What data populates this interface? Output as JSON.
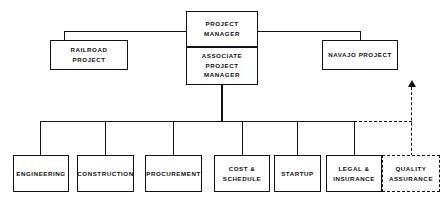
{
  "diagram": {
    "type": "organization-chart",
    "colors": {
      "line": "#111111",
      "box_border": "#111111",
      "background": "#ffffff",
      "text": "#111111"
    },
    "nodes": {
      "project_manager": {
        "label": "PROJECT MANAGER",
        "style": "solid"
      },
      "associate_project_manager": {
        "label": "ASSOCIATE\nPROJECT MANAGER",
        "style": "solid"
      },
      "railroad_project": {
        "label": "RAILROAD PROJECT",
        "style": "solid"
      },
      "navajo_project": {
        "label": "NAVAJO PROJECT",
        "style": "solid"
      },
      "engineering": {
        "label": "ENGINEERING",
        "style": "solid"
      },
      "construction": {
        "label": "CONSTRUCTION",
        "style": "solid"
      },
      "procurement": {
        "label": "PROCUREMENT",
        "style": "solid"
      },
      "cost_schedule": {
        "label": "COST &\nSCHEDULE",
        "style": "solid"
      },
      "startup": {
        "label": "STARTUP",
        "style": "solid"
      },
      "legal_insurance": {
        "label": "LEGAL &\nINSURANCE",
        "style": "solid"
      },
      "quality_assurance": {
        "label": "QUALITY\nASSURANCE",
        "style": "dashed"
      }
    },
    "connectors": [
      {
        "name": "pm-to-railroad",
        "style": "solid"
      },
      {
        "name": "pm-to-navajo",
        "style": "solid"
      },
      {
        "name": "associate-pm-to-bus",
        "style": "solid"
      },
      {
        "name": "department-bus",
        "style": "solid"
      },
      {
        "name": "bus-to-engineering",
        "style": "solid"
      },
      {
        "name": "bus-to-construction",
        "style": "solid"
      },
      {
        "name": "bus-to-procurement",
        "style": "solid"
      },
      {
        "name": "bus-to-cost-schedule",
        "style": "solid"
      },
      {
        "name": "bus-to-startup",
        "style": "solid"
      },
      {
        "name": "bus-to-legal-insurance",
        "style": "solid"
      },
      {
        "name": "quality-assurance-dashed-reporting-line",
        "style": "dashed",
        "arrow": "up"
      }
    ]
  }
}
